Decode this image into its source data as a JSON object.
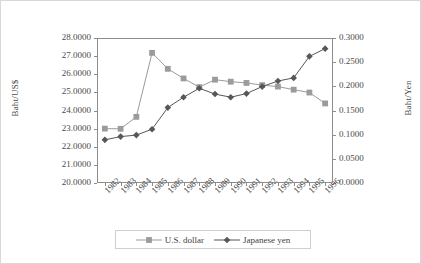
{
  "chart_data": {
    "type": "line",
    "title": "",
    "subtitle": "",
    "xlabel": "",
    "ylabel": "Baht/US$",
    "y2label": "Baht/Yen",
    "grid": false,
    "legend_position": "bottom",
    "categories": [
      "1982",
      "1983",
      "1984",
      "1985",
      "1986",
      "1987",
      "1988",
      "1989",
      "1990",
      "1991",
      "1992",
      "1993",
      "1994",
      "1995",
      "1996"
    ],
    "ylim": [
      20.0,
      28.0
    ],
    "ytick_step": 1.0,
    "yticks": [
      "28.0000",
      "27.0000",
      "26.0000",
      "25.0000",
      "24.0000",
      "23.0000",
      "22.0000",
      "21.0000",
      "20.0000"
    ],
    "y2lim": [
      0.0,
      0.3
    ],
    "y2tick_step": 0.05,
    "y2ticks": [
      "0.3000",
      "0.2500",
      "0.2000",
      "0.1500",
      "0.1000",
      "0.0500",
      "0.0000"
    ],
    "series": [
      {
        "name": "U.S. dollar",
        "axis": "left",
        "marker": "square",
        "color": "#9b9b9b",
        "values": [
          23.0,
          22.99,
          23.65,
          27.18,
          26.3,
          25.77,
          25.29,
          25.7,
          25.59,
          25.52,
          25.4,
          25.32,
          25.15,
          24.99,
          24.39
        ]
      },
      {
        "name": "Japanese yen",
        "axis": "right",
        "marker": "diamond",
        "color": "#575757",
        "values": [
          0.0893,
          0.096,
          0.0991,
          0.1113,
          0.156,
          0.1775,
          0.196,
          0.184,
          0.1775,
          0.185,
          0.1995,
          0.211,
          0.2175,
          0.262,
          0.278
        ]
      }
    ]
  },
  "legend": {
    "items": [
      {
        "label": "U.S. dollar",
        "marker": "square",
        "color": "#9b9b9b"
      },
      {
        "label": "Japanese yen",
        "marker": "diamond",
        "color": "#575757"
      }
    ]
  }
}
